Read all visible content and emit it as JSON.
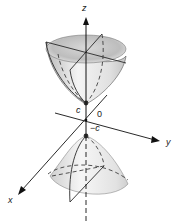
{
  "diagram": {
    "labels": {
      "z_axis": "z",
      "x_axis": "x",
      "y_axis": "y",
      "origin": "0",
      "upper_vertex": "c",
      "lower_vertex": "−c"
    },
    "colors": {
      "surface_light": "#f2f2f2",
      "surface_mid": "#c9c9c9",
      "surface_dark": "#8a8a8a",
      "lines": "#2a2a2a"
    }
  }
}
